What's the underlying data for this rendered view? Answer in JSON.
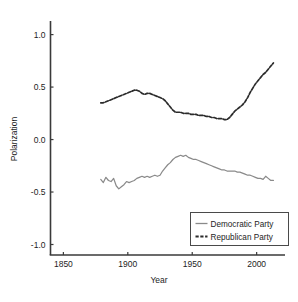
{
  "chart_data": {
    "type": "line",
    "title": "",
    "xlabel": "Year",
    "ylabel": "Polarization",
    "xlim": [
      1840,
      2022
    ],
    "ylim": [
      -1.1,
      1.12
    ],
    "xticks": [
      1850,
      1900,
      1950,
      2000
    ],
    "xtick_labels": [
      "1850",
      "1900",
      "1950",
      "2000"
    ],
    "yticks": [
      1.0,
      0.5,
      0.0,
      -0.5,
      -1.0
    ],
    "ytick_labels": [
      "1.0",
      "0.5",
      "0.0",
      "-0.5",
      "-1.0"
    ],
    "grid": false,
    "legend_position": "lower right",
    "series": [
      {
        "name": "Democratic Party",
        "color": "#8a8a8a",
        "linestyle": "solid",
        "x": [
          1879,
          1881,
          1883,
          1885,
          1887,
          1889,
          1891,
          1893,
          1895,
          1897,
          1899,
          1901,
          1903,
          1905,
          1907,
          1909,
          1911,
          1913,
          1915,
          1917,
          1919,
          1921,
          1923,
          1925,
          1927,
          1929,
          1931,
          1933,
          1935,
          1937,
          1939,
          1941,
          1943,
          1945,
          1947,
          1949,
          1951,
          1953,
          1955,
          1957,
          1959,
          1961,
          1963,
          1965,
          1967,
          1969,
          1971,
          1973,
          1975,
          1977,
          1979,
          1981,
          1983,
          1985,
          1987,
          1989,
          1991,
          1993,
          1995,
          1997,
          1999,
          2001,
          2003,
          2005,
          2007,
          2009,
          2011,
          2013
        ],
        "y": [
          -0.38,
          -0.41,
          -0.36,
          -0.39,
          -0.4,
          -0.37,
          -0.44,
          -0.47,
          -0.45,
          -0.43,
          -0.4,
          -0.41,
          -0.4,
          -0.39,
          -0.37,
          -0.36,
          -0.35,
          -0.36,
          -0.35,
          -0.36,
          -0.35,
          -0.34,
          -0.35,
          -0.34,
          -0.3,
          -0.27,
          -0.24,
          -0.22,
          -0.19,
          -0.17,
          -0.16,
          -0.15,
          -0.16,
          -0.15,
          -0.17,
          -0.18,
          -0.19,
          -0.19,
          -0.2,
          -0.21,
          -0.22,
          -0.23,
          -0.24,
          -0.25,
          -0.26,
          -0.27,
          -0.28,
          -0.29,
          -0.29,
          -0.3,
          -0.3,
          -0.3,
          -0.3,
          -0.31,
          -0.31,
          -0.32,
          -0.33,
          -0.34,
          -0.34,
          -0.35,
          -0.36,
          -0.37,
          -0.37,
          -0.38,
          -0.35,
          -0.37,
          -0.39,
          -0.39
        ]
      },
      {
        "name": "Republican Party",
        "color": "#2b2b2b",
        "linestyle": "dashed",
        "x": [
          1879,
          1881,
          1883,
          1885,
          1887,
          1889,
          1891,
          1893,
          1895,
          1897,
          1899,
          1901,
          1903,
          1905,
          1907,
          1909,
          1911,
          1913,
          1915,
          1917,
          1919,
          1921,
          1923,
          1925,
          1927,
          1929,
          1931,
          1933,
          1935,
          1937,
          1939,
          1941,
          1943,
          1945,
          1947,
          1949,
          1951,
          1953,
          1955,
          1957,
          1959,
          1961,
          1963,
          1965,
          1967,
          1969,
          1971,
          1973,
          1975,
          1977,
          1979,
          1981,
          1983,
          1985,
          1987,
          1989,
          1991,
          1993,
          1995,
          1997,
          1999,
          2001,
          2003,
          2005,
          2007,
          2009,
          2011,
          2013
        ],
        "y": [
          0.35,
          0.35,
          0.36,
          0.37,
          0.38,
          0.39,
          0.4,
          0.41,
          0.42,
          0.43,
          0.44,
          0.45,
          0.46,
          0.47,
          0.47,
          0.46,
          0.44,
          0.43,
          0.44,
          0.44,
          0.43,
          0.42,
          0.41,
          0.4,
          0.39,
          0.37,
          0.34,
          0.31,
          0.28,
          0.26,
          0.26,
          0.26,
          0.25,
          0.25,
          0.25,
          0.24,
          0.24,
          0.24,
          0.23,
          0.23,
          0.23,
          0.22,
          0.22,
          0.21,
          0.21,
          0.2,
          0.2,
          0.2,
          0.19,
          0.19,
          0.21,
          0.24,
          0.27,
          0.29,
          0.31,
          0.33,
          0.36,
          0.4,
          0.45,
          0.49,
          0.53,
          0.56,
          0.59,
          0.62,
          0.64,
          0.67,
          0.7,
          0.73
        ]
      }
    ]
  },
  "legend": {
    "items": [
      {
        "label": "Democratic Party"
      },
      {
        "label": "Republican Party"
      }
    ]
  }
}
